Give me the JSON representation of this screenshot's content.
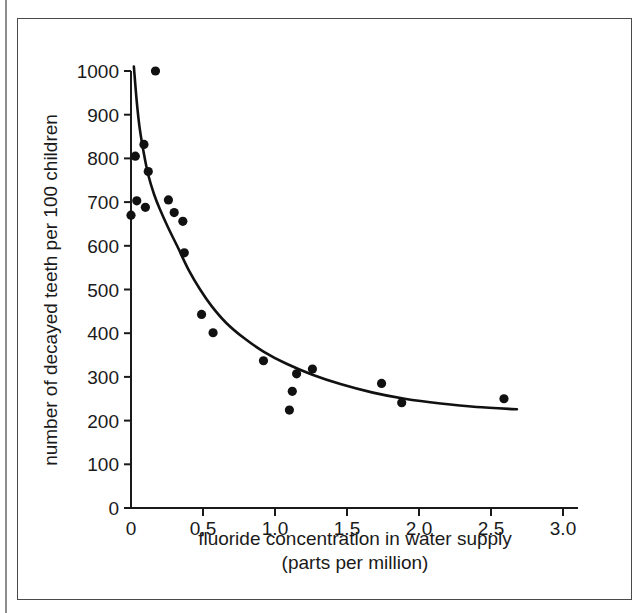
{
  "figure": {
    "background_color": "#ffffff",
    "frame_color": "#4a4a4a",
    "ink_color": "#111111"
  },
  "chart_data": {
    "type": "scatter",
    "title": "",
    "subtitle": "",
    "xlabel": "fluoride concentration in water supply",
    "xlabel_line2": "(parts per million)",
    "ylabel": "number of decayed teeth per 100 children",
    "xlim": [
      0,
      3.0
    ],
    "ylim": [
      0,
      1000
    ],
    "xticks": [
      0,
      0.5,
      1.0,
      1.5,
      2.0,
      2.5,
      3.0
    ],
    "xticklabels": [
      "0",
      "0.5",
      "1.0",
      "1.5",
      "2.0",
      "2.5",
      "3.0"
    ],
    "yticks": [
      0,
      100,
      200,
      300,
      400,
      500,
      600,
      700,
      800,
      900,
      1000
    ],
    "yticklabels": [
      "0",
      "100",
      "200",
      "300",
      "400",
      "500",
      "600",
      "700",
      "800",
      "900",
      "1000"
    ],
    "grid": false,
    "legend": null,
    "marker": "filled-circle",
    "marker_color": "#111111",
    "points": [
      {
        "x": 0.0,
        "y": 670
      },
      {
        "x": 0.03,
        "y": 805
      },
      {
        "x": 0.04,
        "y": 703
      },
      {
        "x": 0.09,
        "y": 832
      },
      {
        "x": 0.1,
        "y": 688
      },
      {
        "x": 0.12,
        "y": 770
      },
      {
        "x": 0.17,
        "y": 1000
      },
      {
        "x": 0.26,
        "y": 705
      },
      {
        "x": 0.3,
        "y": 676
      },
      {
        "x": 0.36,
        "y": 656
      },
      {
        "x": 0.37,
        "y": 584
      },
      {
        "x": 0.49,
        "y": 443
      },
      {
        "x": 0.57,
        "y": 401
      },
      {
        "x": 0.92,
        "y": 337
      },
      {
        "x": 1.1,
        "y": 224
      },
      {
        "x": 1.12,
        "y": 267
      },
      {
        "x": 1.15,
        "y": 307
      },
      {
        "x": 1.26,
        "y": 318
      },
      {
        "x": 1.74,
        "y": 285
      },
      {
        "x": 1.88,
        "y": 241
      },
      {
        "x": 2.59,
        "y": 250
      }
    ],
    "fit_curve": {
      "description": "smooth monotonic decreasing fitted curve",
      "color": "#111111",
      "points": [
        {
          "x": 0.02,
          "y": 1010
        },
        {
          "x": 0.04,
          "y": 930
        },
        {
          "x": 0.06,
          "y": 870
        },
        {
          "x": 0.09,
          "y": 810
        },
        {
          "x": 0.12,
          "y": 762
        },
        {
          "x": 0.16,
          "y": 718
        },
        {
          "x": 0.2,
          "y": 684
        },
        {
          "x": 0.26,
          "y": 640
        },
        {
          "x": 0.32,
          "y": 600
        },
        {
          "x": 0.4,
          "y": 545
        },
        {
          "x": 0.48,
          "y": 500
        },
        {
          "x": 0.56,
          "y": 462
        },
        {
          "x": 0.66,
          "y": 424
        },
        {
          "x": 0.78,
          "y": 390
        },
        {
          "x": 0.92,
          "y": 358
        },
        {
          "x": 1.08,
          "y": 330
        },
        {
          "x": 1.26,
          "y": 305
        },
        {
          "x": 1.46,
          "y": 283
        },
        {
          "x": 1.68,
          "y": 264
        },
        {
          "x": 1.9,
          "y": 250
        },
        {
          "x": 2.15,
          "y": 239
        },
        {
          "x": 2.4,
          "y": 231
        },
        {
          "x": 2.68,
          "y": 226
        }
      ]
    }
  },
  "axes_geometry": {
    "origin_px": {
      "x": 131,
      "y": 508
    },
    "x_end_px": 563,
    "y_top_px": 71
  }
}
